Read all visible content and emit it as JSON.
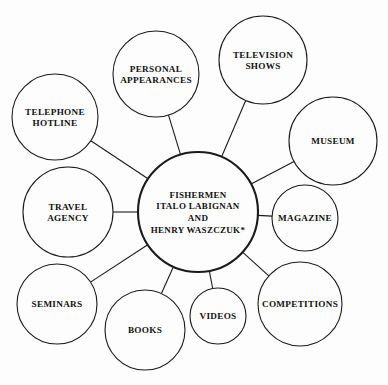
{
  "diagram": {
    "type": "mind-map",
    "title_node": {
      "name": "center-node",
      "lines": [
        "FISHERMEN",
        "ITALO LABIGNAN",
        "AND",
        "HENRY WASZCZUK*"
      ],
      "cx": 198,
      "cy": 212,
      "r": 60
    },
    "colors": {
      "background": "#fdfdfd",
      "stroke": "#1a1a1a",
      "text": "#111111",
      "node_fill": "#fdfdfd"
    },
    "nodes": [
      {
        "id": "personal-appearances",
        "lines": [
          "PERSONAL",
          "APPEARANCES"
        ],
        "cx": 156,
        "cy": 74,
        "r": 43
      },
      {
        "id": "television-shows",
        "lines": [
          "TELEVISION",
          "SHOWS"
        ],
        "cx": 263,
        "cy": 60,
        "r": 44
      },
      {
        "id": "telephone-hotline",
        "lines": [
          "TELEPHONE",
          "HOTLINE"
        ],
        "cx": 55,
        "cy": 117,
        "r": 43
      },
      {
        "id": "museum",
        "lines": [
          "MUSEUM"
        ],
        "cx": 333,
        "cy": 141,
        "r": 44
      },
      {
        "id": "travel-agency",
        "lines": [
          "TRAVEL",
          "AGENCY"
        ],
        "cx": 68,
        "cy": 212,
        "r": 45
      },
      {
        "id": "magazine",
        "lines": [
          "MAGAZINE"
        ],
        "cx": 305,
        "cy": 218,
        "r": 33
      },
      {
        "id": "seminars",
        "lines": [
          "SEMINARS"
        ],
        "cx": 57,
        "cy": 304,
        "r": 40
      },
      {
        "id": "competitions",
        "lines": [
          "COMPETITIONS"
        ],
        "cx": 300,
        "cy": 304,
        "r": 42
      },
      {
        "id": "books",
        "lines": [
          "BOOKS"
        ],
        "cx": 145,
        "cy": 330,
        "r": 40
      },
      {
        "id": "videos",
        "lines": [
          "VIDEOS"
        ],
        "cx": 218,
        "cy": 316,
        "r": 28
      }
    ],
    "edges": [
      {
        "from": "center-node",
        "to": "personal-appearances"
      },
      {
        "from": "center-node",
        "to": "television-shows"
      },
      {
        "from": "center-node",
        "to": "telephone-hotline"
      },
      {
        "from": "center-node",
        "to": "museum"
      },
      {
        "from": "center-node",
        "to": "travel-agency"
      },
      {
        "from": "center-node",
        "to": "magazine"
      },
      {
        "from": "center-node",
        "to": "seminars"
      },
      {
        "from": "center-node",
        "to": "competitions"
      },
      {
        "from": "center-node",
        "to": "books"
      },
      {
        "from": "center-node",
        "to": "videos"
      }
    ]
  }
}
